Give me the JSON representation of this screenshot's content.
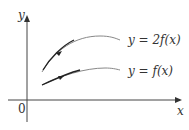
{
  "axes": {
    "x_label": "x",
    "y_label": "y",
    "origin_label": "0"
  },
  "curves": [
    {
      "name": "scaled",
      "label": "y = 2f(x)"
    },
    {
      "name": "base",
      "label": "y = f(x)"
    }
  ],
  "colors": {
    "axis": "#333333",
    "curve": "#777777",
    "highlight": "#222222"
  }
}
